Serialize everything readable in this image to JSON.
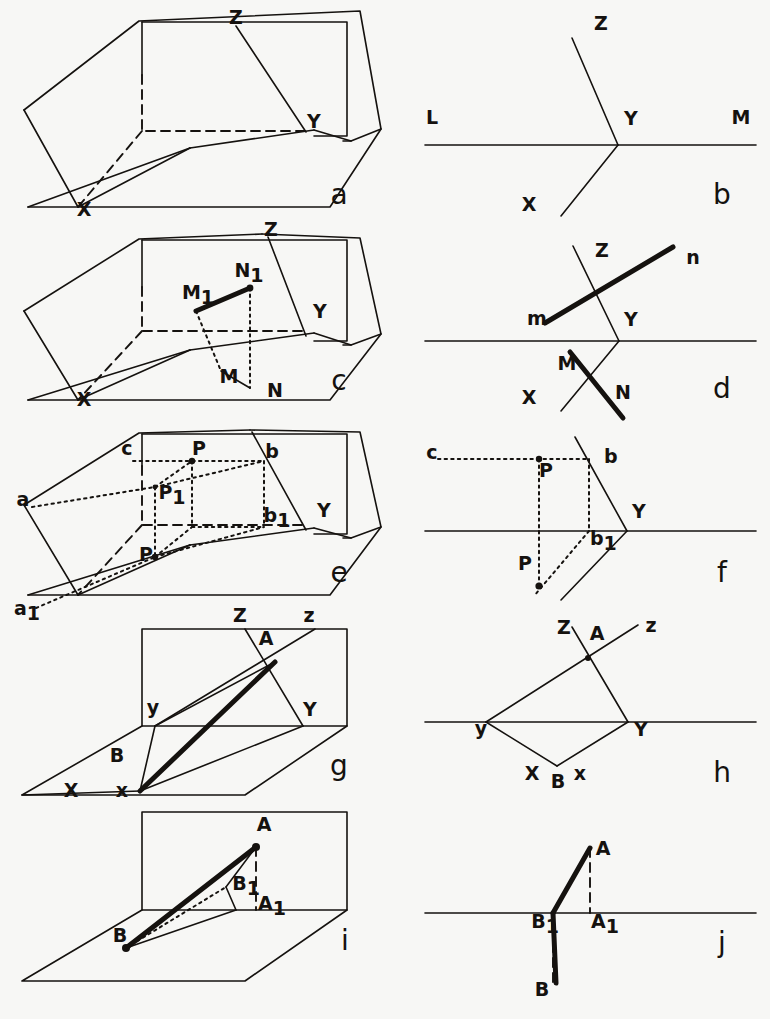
{
  "plate": {
    "width": 770,
    "height": 1019,
    "background": "#f7f7f5",
    "ink_color": "#15120f",
    "description": "Ten descriptive-geometry figures, a through j, in two columns: left column pictorial 3D views, right column folded-flat orthographic views."
  },
  "figures": [
    {
      "id": "a",
      "caption": "a",
      "caption_pos": [
        339,
        204
      ],
      "kind": "pictorial",
      "points": [
        {
          "label": "Z",
          "pos": [
            236,
            24
          ],
          "anchor": "middle"
        },
        {
          "label": "Y",
          "pos": [
            314,
            128
          ],
          "anchor": "middle"
        },
        {
          "label": "X",
          "pos": [
            84,
            216
          ],
          "anchor": "middle"
        }
      ],
      "solid_paths": [
        "M 142,22 L 347,22 L 347,136 L 314,136",
        "M 142,22 L 142,75",
        "M 24,110 L 139,21 L 360,11 L 381,129 L 351,141 L 343,141",
        "M 24,110 L 78,207",
        "M 78,207 L 190,148",
        "M 28,207 L 78,207 L 330,207 L 381,129",
        "M 28,207 L 190,148",
        "M 190,148 L 314,130",
        "M 236,26 L 306,132",
        "M 314,130 L 351,141"
      ],
      "dashed_paths": [
        "M 142,75 L 142,131 L 306,131",
        "M 142,131 L 78,207"
      ],
      "dots": []
    },
    {
      "id": "b",
      "caption": "b",
      "caption_pos": [
        722,
        204
      ],
      "kind": "folded",
      "points": [
        {
          "label": "Z",
          "pos": [
            601,
            30
          ],
          "anchor": "middle"
        },
        {
          "label": "Y",
          "pos": [
            624,
            125
          ],
          "anchor": "start"
        },
        {
          "label": "X",
          "pos": [
            529,
            211
          ],
          "anchor": "middle"
        },
        {
          "label": "L",
          "pos": [
            432,
            124
          ],
          "anchor": "middle"
        },
        {
          "label": "M",
          "pos": [
            741,
            124
          ],
          "anchor": "middle"
        }
      ],
      "solid_paths": [
        "M 425,145 L 756,145",
        "M 572,38 L 618,145",
        "M 618,145 L 561,216"
      ],
      "dashed_paths": [],
      "dots": []
    },
    {
      "id": "c",
      "caption": "c",
      "caption_pos": [
        339,
        390
      ],
      "kind": "pictorial",
      "points": [
        {
          "label": "Z",
          "pos": [
            271,
            236
          ],
          "anchor": "middle"
        },
        {
          "label": "Y",
          "pos": [
            313,
            318
          ],
          "anchor": "start"
        },
        {
          "label": "X",
          "pos": [
            84,
            406
          ],
          "anchor": "middle"
        },
        {
          "label": "M",
          "pos": [
            229,
            383
          ],
          "anchor": "middle"
        },
        {
          "label": "N",
          "pos": [
            275,
            397
          ],
          "anchor": "middle"
        },
        {
          "label": "M1",
          "pos": [
            198,
            299
          ],
          "anchor": "middle",
          "base": "M",
          "sub": "1"
        },
        {
          "label": "N1",
          "pos": [
            249,
            277
          ],
          "anchor": "middle",
          "base": "N",
          "sub": "1"
        }
      ],
      "solid_paths": [
        "M 142,240 L 347,240 L 347,341 L 314,341",
        "M 142,240 L 142,287",
        "M 24,311 L 139,239 L 262,234",
        "M 262,234 L 360,238 L 381,334 L 351,345 L 343,345",
        "M 24,311 L 78,400",
        "M 78,400 L 190,350",
        "M 28,400 L 78,400 L 330,400 L 381,334",
        "M 28,400 L 190,350",
        "M 190,350 L 314,333",
        "M 268,237 L 306,336",
        "M 314,333 L 351,345",
        "M 221,371 L 250,388"
      ],
      "dashed_paths": [
        "M 142,287 L 142,331 L 306,331",
        "M 142,331 L 78,400"
      ],
      "dotted_paths": [
        "M 250,288 L 250,388",
        "M 196,311 L 221,371"
      ],
      "bold_paths": [
        "M 196,311 L 250,288"
      ],
      "dots": [
        {
          "pos": [
            250,
            288
          ],
          "r": 3.4
        }
      ]
    },
    {
      "id": "d",
      "caption": "d",
      "caption_pos": [
        722,
        398
      ],
      "kind": "folded",
      "points": [
        {
          "label": "Z",
          "pos": [
            602,
            257
          ],
          "anchor": "middle"
        },
        {
          "label": "Y",
          "pos": [
            624,
            326
          ],
          "anchor": "start"
        },
        {
          "label": "X",
          "pos": [
            529,
            404
          ],
          "anchor": "middle"
        },
        {
          "label": "m",
          "pos": [
            537,
            325
          ],
          "anchor": "middle"
        },
        {
          "label": "n",
          "pos": [
            693,
            264
          ],
          "anchor": "middle"
        },
        {
          "label": "M",
          "pos": [
            567,
            370
          ],
          "anchor": "middle"
        },
        {
          "label": "N",
          "pos": [
            623,
            399
          ],
          "anchor": "middle"
        }
      ],
      "solid_paths": [
        "M 425,341 L 756,341",
        "M 573,246 L 619,341",
        "M 619,341 L 561,411"
      ],
      "bold_paths": [
        "M 545,323 L 673,247",
        "M 570,352 L 623,418"
      ],
      "dots": []
    },
    {
      "id": "e",
      "caption": "e",
      "caption_pos": [
        339,
        582
      ],
      "kind": "pictorial",
      "points": [
        {
          "label": "Y",
          "pos": [
            317,
            517
          ],
          "anchor": "start"
        },
        {
          "label": "a",
          "pos": [
            23,
            506
          ],
          "anchor": "middle"
        },
        {
          "label": "a1",
          "pos": [
            27,
            615
          ],
          "anchor": "middle",
          "base": "a",
          "sub": "1"
        },
        {
          "label": "b",
          "pos": [
            272,
            458
          ],
          "anchor": "middle"
        },
        {
          "label": "b1",
          "pos": [
            277,
            522
          ],
          "anchor": "middle",
          "base": "b",
          "sub": "1"
        },
        {
          "label": "c",
          "pos": [
            127,
            455
          ],
          "anchor": "middle"
        },
        {
          "label": "P",
          "pos": [
            199,
            455
          ],
          "anchor": "middle"
        },
        {
          "label": "P1",
          "pos": [
            172,
            499
          ],
          "anchor": "middle",
          "base": "P",
          "sub": "1"
        },
        {
          "label": "P_low",
          "pos": [
            146,
            561
          ],
          "anchor": "middle",
          "base": "P",
          "sub": ""
        }
      ],
      "solid_paths": [
        "M 142,434 L 347,434 L 347,534 L 314,534",
        "M 142,434 L 142,466",
        "M 24,505 L 139,433 L 250,430",
        "M 250,430 L 360,432 L 381,527 L 351,538 L 343,538",
        "M 24,505 L 78,595",
        "M 78,595 L 190,545",
        "M 28,595 L 78,595 L 330,595 L 381,527",
        "M 28,595 L 190,545",
        "M 190,545 L 314,528",
        "M 252,432 L 306,530",
        "M 314,528 L 351,538"
      ],
      "dashed_paths": [
        "M 142,466 L 142,525 L 306,525",
        "M 142,525 L 78,595"
      ],
      "dotted_paths": [
        "M 133,461 L 264,461",
        "M 264,461 L 264,527",
        "M 192,461 L 192,527",
        "M 155,487 L 155,557",
        "M 155,487 L 192,461",
        "M 155,487 L 264,461",
        "M 32,507 L 155,487",
        "M 155,557 L 264,527",
        "M 155,557 L 192,527",
        "M 36,608 L 155,557",
        "M 192,527 L 264,527"
      ],
      "dots": [
        {
          "pos": [
            192,
            461
          ],
          "r": 3.2
        },
        {
          "pos": [
            155,
            557
          ],
          "r": 3.2
        },
        {
          "pos": [
            155,
            487
          ],
          "r": 2.4
        }
      ]
    },
    {
      "id": "f",
      "caption": "f",
      "caption_pos": [
        722,
        582
      ],
      "kind": "folded",
      "points": [
        {
          "label": "c",
          "pos": [
            432,
            459
          ],
          "anchor": "middle"
        },
        {
          "label": "b",
          "pos": [
            604,
            463
          ],
          "anchor": "start"
        },
        {
          "label": "Y",
          "pos": [
            632,
            518
          ],
          "anchor": "start"
        },
        {
          "label": "b1",
          "pos": [
            590,
            545
          ],
          "anchor": "start",
          "base": "b",
          "sub": "1"
        },
        {
          "label": "P",
          "pos": [
            546,
            477
          ],
          "anchor": "middle"
        },
        {
          "label": "P_low",
          "pos": [
            525,
            570
          ],
          "anchor": "middle",
          "base": "P",
          "sub": ""
        }
      ],
      "solid_paths": [
        "M 425,531 L 756,531",
        "M 575,437 L 627,531",
        "M 627,531 L 561,600"
      ],
      "dotted_paths": [
        "M 438,459 L 589,459",
        "M 589,459 L 589,531",
        "M 539,459 L 539,531",
        "M 539,531 L 539,586",
        "M 589,531 L 534,596"
      ],
      "dots": [
        {
          "pos": [
            539,
            459
          ],
          "r": 3.2
        },
        {
          "pos": [
            539,
            586
          ],
          "r": 3.6
        }
      ]
    },
    {
      "id": "g",
      "caption": "g",
      "caption_pos": [
        339,
        775
      ],
      "kind": "pictorial",
      "points": [
        {
          "label": "Z",
          "pos": [
            240,
            622
          ],
          "anchor": "middle"
        },
        {
          "label": "z",
          "pos": [
            309,
            622
          ],
          "anchor": "middle"
        },
        {
          "label": "A",
          "pos": [
            266,
            645
          ],
          "anchor": "middle"
        },
        {
          "label": "Y",
          "pos": [
            310,
            716
          ],
          "anchor": "middle"
        },
        {
          "label": "y",
          "pos": [
            153,
            714
          ],
          "anchor": "middle"
        },
        {
          "label": "B",
          "pos": [
            117,
            762
          ],
          "anchor": "middle"
        },
        {
          "label": "X",
          "pos": [
            71,
            797
          ],
          "anchor": "middle"
        },
        {
          "label": "x",
          "pos": [
            122,
            797
          ],
          "anchor": "middle"
        }
      ],
      "solid_paths": [
        "M 142,629 L 347,629 L 347,726 L 142,726 Z",
        "M 142,726 L 22,795 L 245,795 L 347,726",
        "M 245,629 L 303,726",
        "M 315,629 L 155,726",
        "M 155,726 L 140,791",
        "M 22,795 L 140,791",
        "M 303,726 L 140,791",
        "M 155,726 L 275,662"
      ],
      "bold_paths": [
        "M 275,662 L 140,791"
      ],
      "dots": []
    },
    {
      "id": "h",
      "caption": "h",
      "caption_pos": [
        722,
        782
      ],
      "kind": "folded",
      "points": [
        {
          "label": "Z",
          "pos": [
            564,
            634
          ],
          "anchor": "middle"
        },
        {
          "label": "A",
          "pos": [
            597,
            640
          ],
          "anchor": "middle"
        },
        {
          "label": "z",
          "pos": [
            651,
            632
          ],
          "anchor": "middle"
        },
        {
          "label": "Y",
          "pos": [
            634,
            736
          ],
          "anchor": "start"
        },
        {
          "label": "y",
          "pos": [
            481,
            735
          ],
          "anchor": "middle"
        },
        {
          "label": "X",
          "pos": [
            532,
            780
          ],
          "anchor": "middle"
        },
        {
          "label": "B",
          "pos": [
            558,
            788
          ],
          "anchor": "middle"
        },
        {
          "label": "x",
          "pos": [
            580,
            780
          ],
          "anchor": "middle"
        }
      ],
      "solid_paths": [
        "M 425,722 L 756,722",
        "M 572,627 L 628,722",
        "M 628,722 L 557,766",
        "M 486,722 L 557,766",
        "M 486,722 L 638,625"
      ],
      "dots": [
        {
          "pos": [
            588,
            658
          ],
          "r": 3.0
        }
      ]
    },
    {
      "id": "i",
      "caption": "i",
      "caption_pos": [
        345,
        950
      ],
      "kind": "pictorial",
      "points": [
        {
          "label": "A",
          "pos": [
            264,
            831
          ],
          "anchor": "middle"
        },
        {
          "label": "B1",
          "pos": [
            246,
            890
          ],
          "anchor": "middle",
          "base": "B",
          "sub": "1"
        },
        {
          "label": "A1",
          "pos": [
            272,
            910
          ],
          "anchor": "middle",
          "base": "A",
          "sub": "1"
        },
        {
          "label": "B",
          "pos": [
            120,
            942
          ],
          "anchor": "middle"
        }
      ],
      "solid_paths": [
        "M 142,812 L 347,812 L 347,910 L 142,910 Z",
        "M 142,910 L 22,981 L 245,981 L 347,910",
        "M 256,847 L 226,887",
        "M 226,887 L 236,910",
        "M 126,948 L 236,910"
      ],
      "bold_paths": [
        "M 256,847 L 126,948"
      ],
      "dotted_paths": [
        "M 126,948 L 226,887"
      ],
      "dashed_paths": [
        "M 256,847 L 256,910"
      ],
      "dots": [
        {
          "pos": [
            256,
            847
          ],
          "r": 4.0
        },
        {
          "pos": [
            126,
            948
          ],
          "r": 4.0
        }
      ]
    },
    {
      "id": "j",
      "caption": "j",
      "caption_pos": [
        722,
        952
      ],
      "kind": "folded",
      "points": [
        {
          "label": "A",
          "pos": [
            603,
            855
          ],
          "anchor": "middle"
        },
        {
          "label": "B1",
          "pos": [
            545,
            928
          ],
          "anchor": "middle",
          "base": "B",
          "sub": "1"
        },
        {
          "label": "A1",
          "pos": [
            605,
            928
          ],
          "anchor": "middle",
          "base": "A",
          "sub": "1"
        },
        {
          "label": "B",
          "pos": [
            542,
            996
          ],
          "anchor": "middle"
        }
      ],
      "solid_paths": [
        "M 425,913 L 756,913"
      ],
      "bold_paths": [
        "M 590,848 L 553,913",
        "M 553,913 L 556,983"
      ],
      "dashed_paths": [
        "M 590,848 L 590,913",
        "M 553,913 L 553,983"
      ],
      "dots": []
    }
  ]
}
